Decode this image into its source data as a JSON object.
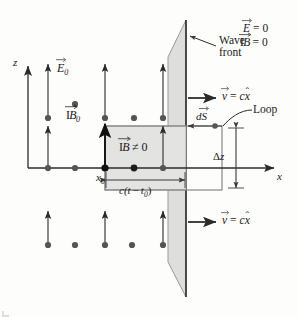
{
  "figure": {
    "kind": "physics-diagram",
    "background": "#fdfdfb",
    "colors": {
      "ink": "#1a1a1a",
      "line": "#3b3b3b",
      "shade_plane": "#dededc",
      "shade_plane_stroke": "#9a9a98",
      "shade_box": "#e3e3e1",
      "shade_box_stroke": "#a8a8a6",
      "loop_stroke": "#7d7d7b",
      "dot": "#555555"
    }
  },
  "axes": {
    "z_label": "z",
    "x_label": "x"
  },
  "labels": {
    "E0": {
      "symbol": "E",
      "sub": "0",
      "vector": true
    },
    "B0": {
      "symbol": "B",
      "sub": "0",
      "vector": true,
      "blackboard": true
    },
    "B_nonzero": {
      "symbol": "B",
      "relation": "≠ 0",
      "vector": true,
      "blackboard": true
    },
    "E_zero": {
      "symbol": "E",
      "relation": "= 0",
      "vector": true
    },
    "B_zero": {
      "symbol": "B",
      "relation": "= 0",
      "vector": true,
      "blackboard": true
    },
    "wave_front": {
      "line1": "Wave",
      "line2": "front"
    },
    "loop": "Loop",
    "dS": {
      "symbol": "dS",
      "vector": true
    },
    "x0": {
      "symbol": "x",
      "sub": "0"
    },
    "ct_minus_t0": {
      "prefix": "c(t",
      "minus": "−",
      "suffix": "t",
      "sub": "0",
      "close": ")"
    },
    "delta_z": {
      "delta": "Δ",
      "symbol": "z"
    },
    "v_top": {
      "lhs": "v",
      "eq": "=",
      "coef": "c",
      "unit": "x",
      "hat": "ˆ"
    },
    "v_bottom": {
      "lhs": "v",
      "eq": "=",
      "coef": "c",
      "unit": "x",
      "hat": "ˆ"
    }
  },
  "geometry": {
    "origin": {
      "x": 28,
      "y": 168
    },
    "x_axis_end": 278,
    "z_axis_top": 62,
    "wavefront_x": 186,
    "field_columns": [
      48,
      75,
      105,
      132,
      163
    ],
    "field_rows_y": [
      118,
      168,
      245
    ],
    "loop": {
      "left": 105,
      "right": 222,
      "top": 126,
      "bottom": 190
    }
  }
}
